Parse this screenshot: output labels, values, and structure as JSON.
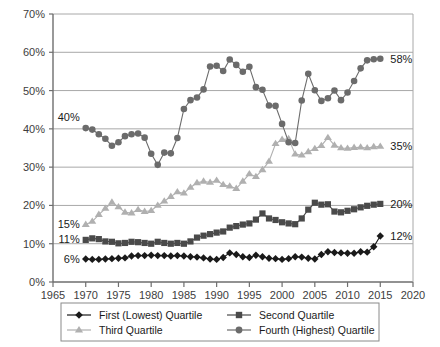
{
  "chart_data": {
    "type": "line",
    "title": "",
    "xlabel": "",
    "ylabel": "",
    "xlim": [
      1965,
      2020
    ],
    "ylim": [
      0,
      0.7
    ],
    "grid": true,
    "legend_position": "bottom",
    "x_ticks": [
      "1965",
      "1970",
      "1975",
      "1980",
      "1985",
      "1990",
      "1995",
      "2000",
      "2005",
      "2010",
      "2015",
      "2020"
    ],
    "y_ticks": [
      "0%",
      "10%",
      "20%",
      "30%",
      "40%",
      "50%",
      "60%",
      "70%"
    ],
    "x": [
      1970,
      1971,
      1972,
      1973,
      1974,
      1975,
      1976,
      1977,
      1978,
      1979,
      1980,
      1981,
      1982,
      1983,
      1984,
      1985,
      1986,
      1987,
      1988,
      1989,
      1990,
      1991,
      1992,
      1993,
      1994,
      1995,
      1996,
      1997,
      1998,
      1999,
      2000,
      2001,
      2002,
      2003,
      2004,
      2005,
      2006,
      2007,
      2008,
      2009,
      2010,
      2011,
      2012,
      2013,
      2014,
      2015
    ],
    "series": [
      {
        "name": "First (Lowest) Quartile",
        "marker": "diamond",
        "color": "#1a1a1a",
        "start_label": "6%",
        "end_label": "12%",
        "values": [
          6.0,
          5.9,
          5.9,
          6.0,
          6.1,
          6.2,
          6.3,
          6.8,
          6.9,
          6.9,
          7.0,
          6.9,
          6.9,
          6.8,
          6.9,
          6.8,
          6.6,
          6.5,
          6.3,
          6.0,
          5.9,
          6.4,
          7.6,
          7.2,
          6.6,
          6.4,
          7.0,
          6.6,
          6.2,
          6.1,
          5.9,
          6.1,
          6.6,
          6.5,
          6.2,
          6.0,
          7.2,
          7.9,
          7.7,
          7.6,
          7.5,
          7.5,
          7.9,
          7.8,
          9.2,
          12.0
        ]
      },
      {
        "name": "Second Quartile",
        "marker": "square",
        "color": "#4a4a4a",
        "start_label": "11%",
        "end_label": "20%",
        "values": [
          11.0,
          11.4,
          11.2,
          10.6,
          10.5,
          10.1,
          10.2,
          10.5,
          10.4,
          10.2,
          10.0,
          10.5,
          10.2,
          10.0,
          10.2,
          10.0,
          10.6,
          11.6,
          12.1,
          12.5,
          12.9,
          13.2,
          14.2,
          14.6,
          15.0,
          15.3,
          16.3,
          17.9,
          16.6,
          16.2,
          15.6,
          15.3,
          15.1,
          16.6,
          18.9,
          20.7,
          20.2,
          20.3,
          18.4,
          18.2,
          18.6,
          19.0,
          19.5,
          19.9,
          20.2,
          20.4
        ]
      },
      {
        "name": "Third Quartile",
        "marker": "triangle",
        "color": "#b0b0b0",
        "start_label": "15%",
        "end_label": "35%",
        "values": [
          15.0,
          15.8,
          17.6,
          19.2,
          20.8,
          19.6,
          18.2,
          18.0,
          18.9,
          18.4,
          18.6,
          20.0,
          21.1,
          22.3,
          23.5,
          23.2,
          24.7,
          25.9,
          26.3,
          26.0,
          26.5,
          25.4,
          25.0,
          24.4,
          26.3,
          28.2,
          27.5,
          29.3,
          31.5,
          36.1,
          37.2,
          37.4,
          33.4,
          33.1,
          34.0,
          34.8,
          35.6,
          37.7,
          35.7,
          35.0,
          34.9,
          35.1,
          35.2,
          35.0,
          35.3,
          35.4
        ]
      },
      {
        "name": "Fourth (Highest) Quartile",
        "marker": "circle",
        "color": "#6b6b6b",
        "start_label": "40%",
        "end_label": "58%",
        "values": [
          40.2,
          39.8,
          38.6,
          37.4,
          35.6,
          36.5,
          38.1,
          38.6,
          38.8,
          37.7,
          33.5,
          30.6,
          33.8,
          33.6,
          37.6,
          45.2,
          47.5,
          48.2,
          50.3,
          56.3,
          56.5,
          55.1,
          58.1,
          56.7,
          54.9,
          56.2,
          50.9,
          50.2,
          46.1,
          46.0,
          41.3,
          36.5,
          36.3,
          47.4,
          54.4,
          50.1,
          47.3,
          48.0,
          50.0,
          47.5,
          49.5,
          52.5,
          55.8,
          57.9,
          58.2,
          58.3
        ]
      }
    ]
  },
  "legend": {
    "items": [
      {
        "label": "First (Lowest) Quartile"
      },
      {
        "label": "Second Quartile"
      },
      {
        "label": "Third Quartile"
      },
      {
        "label": "Fourth (Highest) Quartile"
      }
    ]
  }
}
